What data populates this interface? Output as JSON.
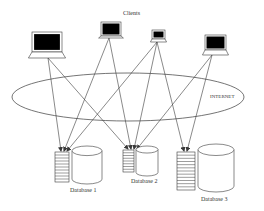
{
  "diagram": {
    "title": "Clients",
    "network_label": "INTERNET",
    "clients": [
      {
        "id": "client-1",
        "x": 32,
        "y": 32,
        "w": 30,
        "h": 20,
        "base_y": 58
      },
      {
        "id": "client-2",
        "x": 101,
        "y": 22,
        "w": 20,
        "h": 14,
        "base_y": 38
      },
      {
        "id": "client-3",
        "x": 152,
        "y": 30,
        "w": 13,
        "h": 9,
        "base_y": 42
      },
      {
        "id": "client-4",
        "x": 205,
        "y": 35,
        "w": 21,
        "h": 15,
        "base_y": 55
      }
    ],
    "databases": [
      {
        "id": "database-1",
        "label": "Database 1",
        "stack_x": 55,
        "stack_y": 152,
        "stack_w": 14,
        "stack_h": 30,
        "stack_rows": 10,
        "cyl_x": 72,
        "cyl_y": 146,
        "cyl_w": 30,
        "cyl_h": 38
      },
      {
        "id": "database-2",
        "label": "Database 2",
        "stack_x": 123,
        "stack_y": 150,
        "stack_w": 11,
        "stack_h": 22,
        "stack_rows": 8,
        "cyl_x": 136,
        "cyl_y": 146,
        "cyl_w": 22,
        "cyl_h": 30
      },
      {
        "id": "database-3",
        "label": "Database 3",
        "stack_x": 177,
        "stack_y": 152,
        "stack_w": 18,
        "stack_h": 38,
        "stack_rows": 12,
        "cyl_x": 198,
        "cyl_y": 144,
        "cyl_w": 36,
        "cyl_h": 48
      }
    ],
    "connections": [
      {
        "from": "client-1",
        "x1": 48,
        "y1": 58,
        "x2": 61,
        "y2": 151
      },
      {
        "from": "client-1",
        "x1": 48,
        "y1": 58,
        "x2": 128,
        "y2": 149
      },
      {
        "from": "client-2",
        "x1": 109,
        "y1": 38,
        "x2": 64,
        "y2": 151
      },
      {
        "from": "client-2",
        "x1": 109,
        "y1": 38,
        "x2": 131,
        "y2": 149
      },
      {
        "from": "client-3",
        "x1": 157,
        "y1": 42,
        "x2": 67,
        "y2": 151
      },
      {
        "from": "client-3",
        "x1": 157,
        "y1": 42,
        "x2": 134,
        "y2": 149
      },
      {
        "from": "client-3",
        "x1": 157,
        "y1": 42,
        "x2": 184,
        "y2": 151
      },
      {
        "from": "client-4",
        "x1": 212,
        "y1": 55,
        "x2": 137,
        "y2": 149
      },
      {
        "from": "client-4",
        "x1": 212,
        "y1": 55,
        "x2": 187,
        "y2": 151
      }
    ],
    "ellipse": {
      "cx": 128,
      "cy": 97,
      "rx": 116,
      "ry": 24
    },
    "colors": {
      "line": "#3a3a3a",
      "screen": "#000000",
      "bg": "#ffffff"
    }
  }
}
